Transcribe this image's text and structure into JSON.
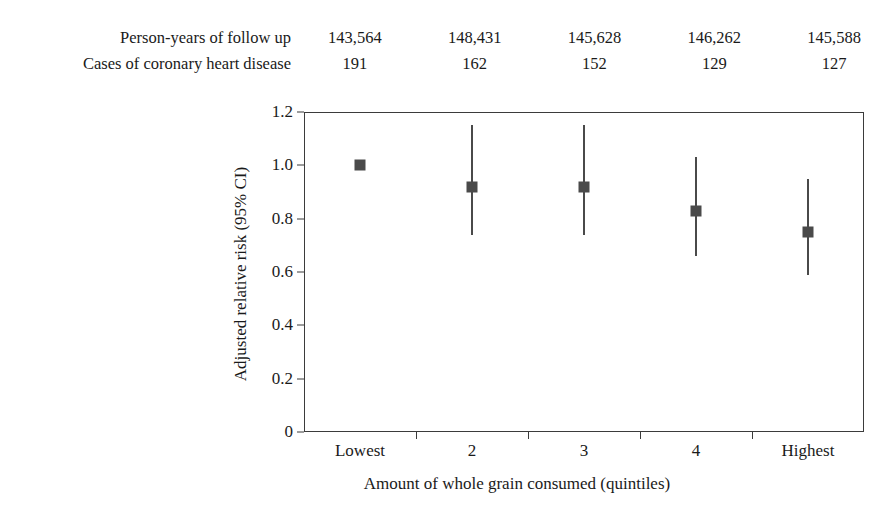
{
  "header": {
    "rows": [
      {
        "label": "Person-years of follow up",
        "values": [
          "143,564",
          "148,431",
          "145,628",
          "146,262",
          "145,588"
        ]
      },
      {
        "label": "Cases of coronary heart disease",
        "values": [
          "191",
          "162",
          "152",
          "129",
          "127"
        ]
      }
    ]
  },
  "chart_data": {
    "type": "scatter",
    "title": "",
    "xlabel": "Amount of whole grain consumed (quintiles)",
    "ylabel": "Adjusted relative risk (95% CI)",
    "categories": [
      "Lowest",
      "2",
      "3",
      "4",
      "Highest"
    ],
    "ylim": [
      0,
      1.2
    ],
    "ytick_labels": [
      "0",
      "0.2",
      "0.4",
      "0.6",
      "0.8",
      "1.0",
      "1.2"
    ],
    "ytick_values": [
      0,
      0.2,
      0.4,
      0.6,
      0.8,
      1.0,
      1.2
    ],
    "grid": false,
    "legend": "none",
    "series": [
      {
        "name": "Adjusted relative risk",
        "values": [
          1.0,
          0.92,
          0.92,
          0.83,
          0.75
        ],
        "ci_low": [
          null,
          0.74,
          0.74,
          0.66,
          0.59
        ],
        "ci_high": [
          null,
          1.15,
          1.15,
          1.03,
          0.95
        ]
      }
    ],
    "annotations": {
      "person_years": [
        143564,
        148431,
        145628,
        146262,
        145588
      ],
      "cases": [
        191,
        162,
        152,
        129,
        127
      ]
    },
    "colors": {
      "marker": "#4a4a4a",
      "axis": "#3b3b3b",
      "background": "#ffffff"
    }
  }
}
